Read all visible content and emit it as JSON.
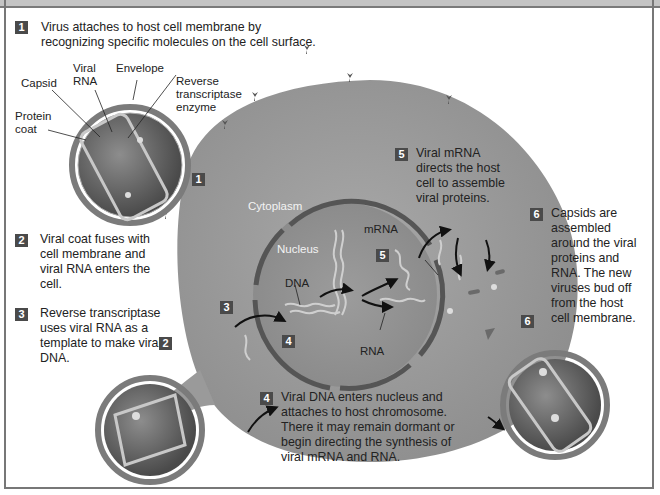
{
  "steps": [
    {
      "number": "1",
      "text_lines": [
        "Virus attaches to host cell membrane by",
        "recognizing specific molecules on the cell surface."
      ]
    },
    {
      "number": "2",
      "text_lines": [
        "Viral coat fuses with",
        "cell membrane and",
        "viral RNA enters the",
        "cell."
      ]
    },
    {
      "number": "3",
      "text_lines": [
        "Reverse transcriptase",
        "uses viral RNA as a",
        "template to make viral",
        "DNA."
      ]
    },
    {
      "number": "4",
      "text_lines": [
        "Viral DNA enters nucleus and",
        "attaches to host chromosome.",
        "There it may remain dormant or",
        "begin directing the synthesis of",
        "viral mRNA and RNA."
      ]
    },
    {
      "number": "5",
      "text_lines": [
        "Viral mRNA",
        "directs the host",
        "cell to assemble",
        "viral proteins."
      ]
    },
    {
      "number": "6",
      "text_lines": [
        "Capsids are",
        "assembled",
        "around the viral",
        "proteins and",
        "RNA. The new",
        "viruses bud off",
        "from the host",
        "cell membrane."
      ]
    }
  ],
  "virus_labels": {
    "viral_rna_1": "Viral",
    "viral_rna_2": "RNA",
    "envelope": "Envelope",
    "capsid": "Capsid",
    "reverse_1": "Reverse",
    "reverse_2": "transcriptase",
    "reverse_3": "enzyme",
    "protein_1": "Protein",
    "protein_2": "coat"
  },
  "cell_labels": {
    "cytoplasm": "Cytoplasm",
    "nucleus": "Nucleus",
    "dna": "DNA",
    "mrna": "mRNA",
    "rna": "RNA"
  },
  "markers": {
    "m1": "1",
    "m2": "2",
    "m3": "3",
    "m4": "4",
    "m5": "5",
    "m6": "6"
  },
  "colors": {
    "cell": "#9a9a9a",
    "nuclear_envelope": "#555555",
    "badge": "#4a4a4a",
    "frame": "#777777"
  }
}
